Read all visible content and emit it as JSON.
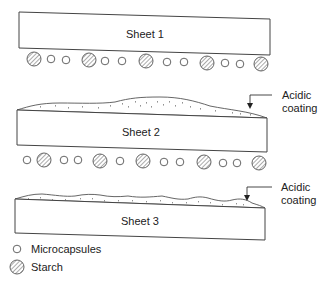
{
  "diagram": {
    "type": "carbonless-paper-layers",
    "sheets": [
      {
        "label": "Sheet 1",
        "coating": null,
        "underside": "microcapsules and starch"
      },
      {
        "label": "Sheet 2",
        "coating": "Acidic coating",
        "underside": "microcapsules and starch"
      },
      {
        "label": "Sheet 3",
        "coating": "Acidic coating",
        "underside": null
      }
    ],
    "callouts": [
      {
        "line1": "Acidic",
        "line2": "coating",
        "target": "Sheet 2 top"
      },
      {
        "line1": "Acidic",
        "line2": "coating",
        "target": "Sheet 3 top"
      }
    ],
    "legend": [
      {
        "symbol": "open-circle",
        "label": "Microcapsules"
      },
      {
        "symbol": "hatched-circle",
        "label": "Starch"
      }
    ]
  },
  "labels": {
    "sheet1": "Sheet 1",
    "sheet2": "Sheet 2",
    "sheet3": "Sheet 3",
    "callout2_l1": "Acidic",
    "callout2_l2": "coating",
    "callout3_l1": "Acidic",
    "callout3_l2": "coating",
    "legend_micro": "Microcapsules",
    "legend_starch": "Starch"
  }
}
